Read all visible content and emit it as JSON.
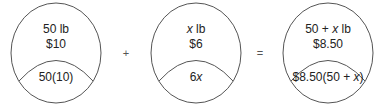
{
  "diagram": {
    "type": "mixture-problem-circles",
    "circles": [
      {
        "top_line1": "50 lb",
        "top_line2": "$10",
        "bottom": "50(10)"
      },
      {
        "top_line1_var": "x",
        "top_line1_rest": " lb",
        "top_line2": "$6",
        "bottom_num": "6",
        "bottom_var": "x"
      },
      {
        "top_line1_pre": "50 + ",
        "top_line1_var": "x",
        "top_line1_rest": " lb",
        "top_line2": "$8.50",
        "bottom_pre": "$8.50(50 + ",
        "bottom_var": "x",
        "bottom_post": ")"
      }
    ],
    "operators": [
      "+",
      "="
    ],
    "colors": {
      "stroke": "#555555",
      "text": "#222222",
      "background": "#ffffff"
    }
  }
}
